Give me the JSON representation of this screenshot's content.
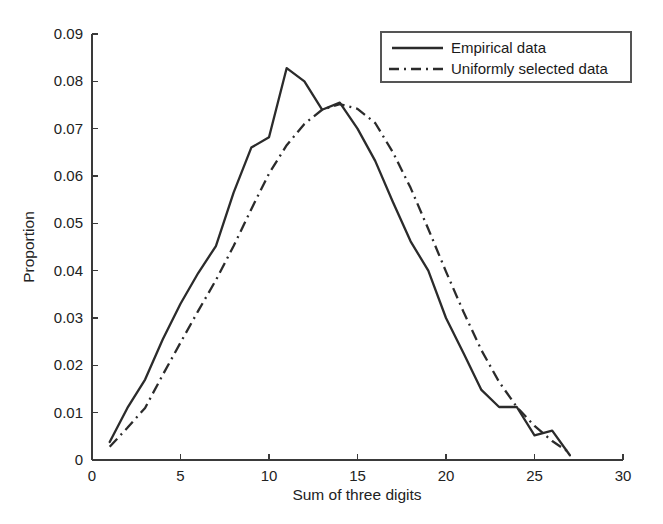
{
  "chart_data": {
    "type": "line",
    "title": "",
    "xlabel": "Sum of three digits",
    "ylabel": "Proportion",
    "xlim": [
      0,
      30
    ],
    "ylim": [
      0,
      0.09
    ],
    "xticks": [
      0,
      5,
      10,
      15,
      20,
      25,
      30
    ],
    "xtick_labels": [
      "0",
      "5",
      "10",
      "15",
      "20",
      "25",
      "30"
    ],
    "yticks": [
      0,
      0.01,
      0.02,
      0.03,
      0.04,
      0.05,
      0.06,
      0.07,
      0.08,
      0.09
    ],
    "ytick_labels": [
      "0",
      "0.01",
      "0.02",
      "0.03",
      "0.04",
      "0.05",
      "0.06",
      "0.07",
      "0.08",
      "0.09"
    ],
    "grid": false,
    "legend_position": "top-right",
    "x": [
      1,
      2,
      3,
      4,
      5,
      6,
      7,
      8,
      9,
      10,
      11,
      12,
      13,
      14,
      15,
      16,
      17,
      18,
      19,
      20,
      21,
      22,
      23,
      24,
      25,
      26,
      27
    ],
    "series": [
      {
        "name": "Empirical data",
        "style": "solid",
        "color": "#2b2b2b",
        "values": [
          0.0038,
          0.011,
          0.017,
          0.0255,
          0.033,
          0.0395,
          0.0452,
          0.0565,
          0.066,
          0.0682,
          0.0828,
          0.08,
          0.074,
          0.0755,
          0.07,
          0.0632,
          0.0545,
          0.0462,
          0.04,
          0.03,
          0.0225,
          0.0148,
          0.0112,
          0.0112,
          0.0052,
          0.0062,
          0.001
        ]
      },
      {
        "name": "Uniformly selected data",
        "style": "dash-dot",
        "color": "#2b2b2b",
        "values": [
          0.0028,
          0.0068,
          0.011,
          0.018,
          0.0248,
          0.0315,
          0.038,
          0.0452,
          0.053,
          0.0605,
          0.0665,
          0.071,
          0.074,
          0.0752,
          0.0742,
          0.0712,
          0.065,
          0.0575,
          0.0488,
          0.0398,
          0.0312,
          0.0232,
          0.0165,
          0.0112,
          0.0072,
          0.004,
          0.0015
        ]
      }
    ]
  },
  "legend": {
    "items": [
      {
        "label": "Empirical data",
        "style": "solid"
      },
      {
        "label": "Uniformly selected data",
        "style": "dash-dot"
      }
    ]
  }
}
